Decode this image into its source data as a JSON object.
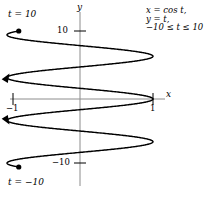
{
  "chart_data": {
    "type": "line",
    "title": "",
    "subtitle": "",
    "xlabel": "x",
    "ylabel": "y",
    "parametric": true,
    "equations": {
      "x_of_t": "x = cos t,",
      "y_of_t": "y = t,",
      "domain": "−10 ≤ t ≤ 10"
    },
    "xlim": [
      -1.35,
      1.35
    ],
    "ylim": [
      -12.4,
      12.4
    ],
    "grid": false,
    "legend": null,
    "x_ticks": [
      {
        "value": -1,
        "label": "−1"
      },
      {
        "value": 1,
        "label": "1"
      }
    ],
    "y_ticks": [
      {
        "value": 10,
        "label": "10"
      },
      {
        "value": -10,
        "label": "−10"
      }
    ],
    "endpoints": [
      {
        "t": 10,
        "label": "t = 10",
        "x": -0.839,
        "y": 10
      },
      {
        "t": -10,
        "label": "t = −10",
        "x": -0.839,
        "y": -10
      }
    ],
    "direction_arrows": [
      {
        "at_t": 3.2,
        "direction": "right"
      },
      {
        "at_t": -3.2,
        "direction": "left"
      }
    ],
    "series": [
      {
        "name": "x = cos t, y = t",
        "t_min": -10,
        "t_max": 10,
        "color": "#000000"
      }
    ]
  },
  "labels": {
    "t_top": "t = 10",
    "t_bottom": "t = −10",
    "axis_x": "x",
    "axis_y": "y",
    "tick_10": "10",
    "tick_neg10": "−10",
    "tick_neg1": "−1",
    "tick_1": "1"
  },
  "equation_lines": {
    "line1": "x = cos t,",
    "line2": "y = t,",
    "line3": "−10 ≤ t ≤ 10"
  },
  "colors": {
    "curve": "#000000",
    "axis": "#8c8c8c",
    "text": "#000000",
    "background": "#ffffff"
  }
}
